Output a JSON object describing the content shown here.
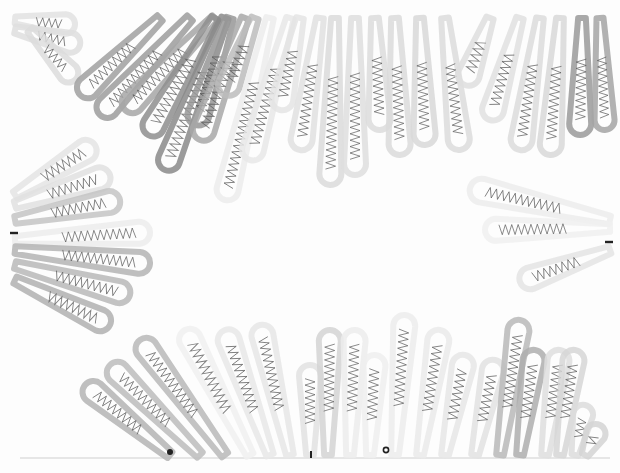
{
  "artwork": {
    "subject": "radial drawing of elongated loop/petal shapes with zigzag lines, arranged around an empty central oval",
    "background": "#fdfdfd",
    "baseline_y": 458,
    "markers": [
      {
        "type": "dash",
        "x": 14,
        "y": 233
      },
      {
        "type": "dash",
        "x": 609,
        "y": 242
      },
      {
        "type": "dot",
        "x": 170,
        "y": 452
      },
      {
        "type": "tick",
        "x": 311,
        "y": 455
      },
      {
        "type": "ring",
        "x": 386,
        "y": 450
      }
    ],
    "loops": [
      {
        "x1": 15,
        "y1": 20,
        "x2": 75,
        "y2": 25,
        "w": 20,
        "shade": "#e2e2e2"
      },
      {
        "x1": 15,
        "y1": 30,
        "x2": 80,
        "y2": 45,
        "w": 20,
        "shade": "#dedede"
      },
      {
        "x1": 30,
        "y1": 30,
        "x2": 75,
        "y2": 80,
        "w": 20,
        "shade": "#dcdcdc"
      },
      {
        "x1": 160,
        "y1": 18,
        "x2": 80,
        "y2": 95,
        "w": 22,
        "shade": "#a0a0a0"
      },
      {
        "x1": 190,
        "y1": 18,
        "x2": 100,
        "y2": 115,
        "w": 22,
        "shade": "#9c9c9c"
      },
      {
        "x1": 215,
        "y1": 18,
        "x2": 125,
        "y2": 110,
        "w": 22,
        "shade": "#a6a6a6"
      },
      {
        "x1": 215,
        "y1": 18,
        "x2": 148,
        "y2": 135,
        "w": 22,
        "shade": "#8e8e8e"
      },
      {
        "x1": 225,
        "y1": 18,
        "x2": 165,
        "y2": 170,
        "w": 22,
        "shade": "#8a8a8a"
      },
      {
        "x1": 230,
        "y1": 18,
        "x2": 195,
        "y2": 125,
        "w": 22,
        "shade": "#979797"
      },
      {
        "x1": 245,
        "y1": 18,
        "x2": 200,
        "y2": 140,
        "w": 22,
        "shade": "#a8a8a8"
      },
      {
        "x1": 255,
        "y1": 18,
        "x2": 225,
        "y2": 95,
        "w": 22,
        "shade": "#bcbcbc"
      },
      {
        "x1": 270,
        "y1": 18,
        "x2": 225,
        "y2": 200,
        "w": 22,
        "shade": "#ececec"
      },
      {
        "x1": 290,
        "y1": 18,
        "x2": 250,
        "y2": 160,
        "w": 22,
        "shade": "#e8e8e8"
      },
      {
        "x1": 300,
        "y1": 18,
        "x2": 280,
        "y2": 110,
        "w": 22,
        "shade": "#e4e4e4"
      },
      {
        "x1": 320,
        "y1": 18,
        "x2": 300,
        "y2": 150,
        "w": 22,
        "shade": "#e0e0e0"
      },
      {
        "x1": 335,
        "y1": 18,
        "x2": 330,
        "y2": 185,
        "w": 22,
        "shade": "#dadada"
      },
      {
        "x1": 355,
        "y1": 18,
        "x2": 355,
        "y2": 175,
        "w": 22,
        "shade": "#dedede"
      },
      {
        "x1": 375,
        "y1": 18,
        "x2": 380,
        "y2": 130,
        "w": 22,
        "shade": "#dcdcdc"
      },
      {
        "x1": 395,
        "y1": 18,
        "x2": 400,
        "y2": 155,
        "w": 22,
        "shade": "#dadada"
      },
      {
        "x1": 420,
        "y1": 18,
        "x2": 425,
        "y2": 145,
        "w": 22,
        "shade": "#d8d8d8"
      },
      {
        "x1": 445,
        "y1": 18,
        "x2": 460,
        "y2": 150,
        "w": 22,
        "shade": "#dcdcdc"
      },
      {
        "x1": 490,
        "y1": 18,
        "x2": 465,
        "y2": 85,
        "w": 22,
        "shade": "#dedede"
      },
      {
        "x1": 520,
        "y1": 18,
        "x2": 490,
        "y2": 120,
        "w": 22,
        "shade": "#e0e0e0"
      },
      {
        "x1": 540,
        "y1": 18,
        "x2": 520,
        "y2": 150,
        "w": 22,
        "shade": "#dcdcdc"
      },
      {
        "x1": 560,
        "y1": 18,
        "x2": 550,
        "y2": 155,
        "w": 22,
        "shade": "#d8d8d8"
      },
      {
        "x1": 582,
        "y1": 18,
        "x2": 580,
        "y2": 135,
        "w": 22,
        "shade": "#9a9a9a"
      },
      {
        "x1": 600,
        "y1": 18,
        "x2": 605,
        "y2": 130,
        "w": 20,
        "shade": "#a4a4a4"
      },
      {
        "x1": 15,
        "y1": 195,
        "x2": 95,
        "y2": 145,
        "w": 22,
        "shade": "#e4e4e4"
      },
      {
        "x1": 15,
        "y1": 205,
        "x2": 110,
        "y2": 175,
        "w": 22,
        "shade": "#e0e0e0"
      },
      {
        "x1": 15,
        "y1": 220,
        "x2": 120,
        "y2": 200,
        "w": 22,
        "shade": "#c4c4c4"
      },
      {
        "x1": 15,
        "y1": 240,
        "x2": 150,
        "y2": 232,
        "w": 22,
        "shade": "#ececec"
      },
      {
        "x1": 15,
        "y1": 250,
        "x2": 150,
        "y2": 264,
        "w": 22,
        "shade": "#b4b4b4"
      },
      {
        "x1": 15,
        "y1": 265,
        "x2": 130,
        "y2": 295,
        "w": 22,
        "shade": "#b8b8b8"
      },
      {
        "x1": 15,
        "y1": 280,
        "x2": 110,
        "y2": 325,
        "w": 22,
        "shade": "#b0b0b0"
      },
      {
        "x1": 610,
        "y1": 220,
        "x2": 470,
        "y2": 188,
        "w": 24,
        "shade": "#ececec"
      },
      {
        "x1": 610,
        "y1": 228,
        "x2": 485,
        "y2": 230,
        "w": 22,
        "shade": "#f0f0f0"
      },
      {
        "x1": 610,
        "y1": 250,
        "x2": 520,
        "y2": 282,
        "w": 22,
        "shade": "#e4e4e4"
      },
      {
        "x1": 170,
        "y1": 455,
        "x2": 85,
        "y2": 385,
        "w": 22,
        "shade": "#b4b4b4"
      },
      {
        "x1": 200,
        "y1": 455,
        "x2": 110,
        "y2": 365,
        "w": 22,
        "shade": "#bcbcbc"
      },
      {
        "x1": 225,
        "y1": 455,
        "x2": 140,
        "y2": 340,
        "w": 22,
        "shade": "#b8b8b8"
      },
      {
        "x1": 250,
        "y1": 455,
        "x2": 185,
        "y2": 330,
        "w": 22,
        "shade": "#f0f0f0"
      },
      {
        "x1": 270,
        "y1": 455,
        "x2": 225,
        "y2": 330,
        "w": 22,
        "shade": "#e8e8e8"
      },
      {
        "x1": 290,
        "y1": 455,
        "x2": 260,
        "y2": 325,
        "w": 22,
        "shade": "#e6e6e6"
      },
      {
        "x1": 310,
        "y1": 455,
        "x2": 310,
        "y2": 365,
        "w": 22,
        "shade": "#e2e2e2"
      },
      {
        "x1": 328,
        "y1": 455,
        "x2": 330,
        "y2": 330,
        "w": 22,
        "shade": "#d4d4d4"
      },
      {
        "x1": 350,
        "y1": 455,
        "x2": 355,
        "y2": 330,
        "w": 22,
        "shade": "#ececec"
      },
      {
        "x1": 370,
        "y1": 455,
        "x2": 375,
        "y2": 355,
        "w": 22,
        "shade": "#efefef"
      },
      {
        "x1": 395,
        "y1": 455,
        "x2": 405,
        "y2": 315,
        "w": 22,
        "shade": "#ececec"
      },
      {
        "x1": 420,
        "y1": 455,
        "x2": 440,
        "y2": 330,
        "w": 22,
        "shade": "#eaeaea"
      },
      {
        "x1": 445,
        "y1": 455,
        "x2": 465,
        "y2": 355,
        "w": 22,
        "shade": "#e6e6e6"
      },
      {
        "x1": 475,
        "y1": 455,
        "x2": 495,
        "y2": 360,
        "w": 22,
        "shade": "#e2e2e2"
      },
      {
        "x1": 500,
        "y1": 455,
        "x2": 520,
        "y2": 320,
        "w": 22,
        "shade": "#b8b8b8"
      },
      {
        "x1": 520,
        "y1": 455,
        "x2": 535,
        "y2": 350,
        "w": 22,
        "shade": "#aeaeae"
      },
      {
        "x1": 545,
        "y1": 455,
        "x2": 560,
        "y2": 350,
        "w": 22,
        "shade": "#dedede"
      },
      {
        "x1": 560,
        "y1": 455,
        "x2": 575,
        "y2": 350,
        "w": 22,
        "shade": "#d6d6d6"
      },
      {
        "x1": 575,
        "y1": 455,
        "x2": 585,
        "y2": 405,
        "w": 20,
        "shade": "#dcdcdc"
      },
      {
        "x1": 585,
        "y1": 455,
        "x2": 600,
        "y2": 425,
        "w": 20,
        "shade": "#d4d4d4"
      }
    ],
    "zigzag_color": "#555555"
  }
}
